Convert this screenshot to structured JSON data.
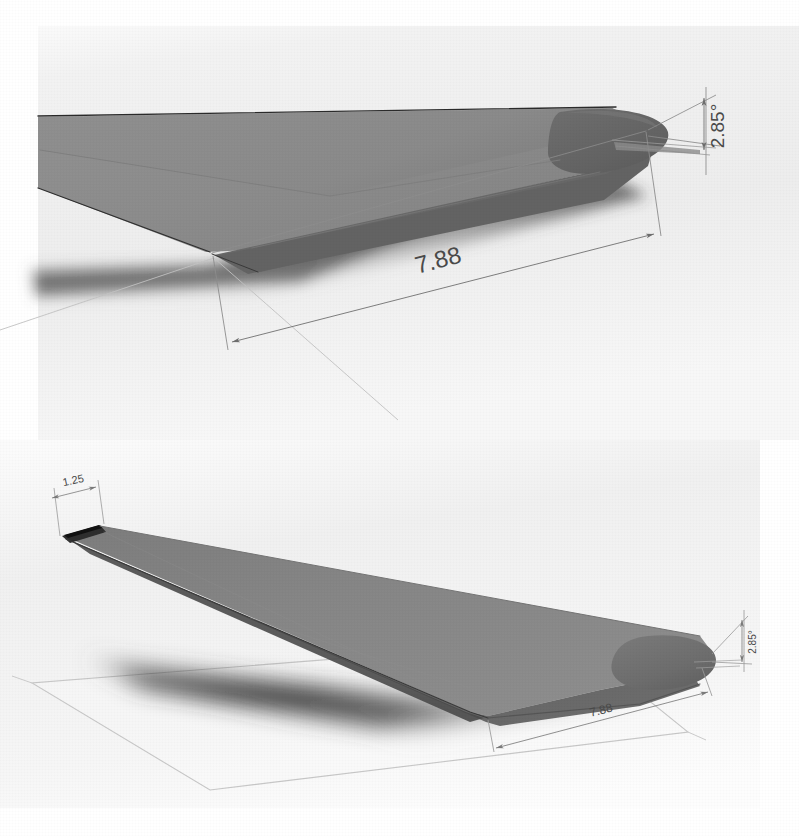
{
  "document": {
    "kind": "cad-render-sheet",
    "background_color": "#ffffff",
    "paper_tint": "#f3f3f3"
  },
  "palette": {
    "wing_upper_surface": "#8d8d8d",
    "wing_upper_surface_light": "#9a9a9a",
    "wing_lower_surface": "#6e6e6e",
    "wing_curved_dark": "#5f5f5f",
    "wing_edge_dark": "#2a2a2a",
    "shadow": "#3b3b3b",
    "dimension_line": "#8a8a8a",
    "dimension_line_dark": "#6d6d6d",
    "sketch_plane_outline": "#c9c9c9",
    "dimension_text": "#4a4a4a"
  },
  "views": [
    {
      "id": "view-top",
      "name": "wing-root-closeup-view",
      "description": "Close-up isometric render of tapered wing root with rounded airfoil leading edge",
      "dimensions": [
        {
          "id": "chord-length-top",
          "name": "chord-dimension",
          "value": "7.88",
          "type": "linear",
          "rotation_deg": -14.5
        },
        {
          "id": "twist-angle-top",
          "name": "angle-dimension",
          "value": "2.85°",
          "type": "angular",
          "rotation_deg": -90
        }
      ]
    },
    {
      "id": "view-bottom",
      "name": "full-wing-isometric-view",
      "description": "Full isometric render of tapered wing with sketch plane and cast shadow",
      "dimensions": [
        {
          "id": "tip-chord-bottom",
          "name": "tip-chord-dimension",
          "value": "1.25",
          "type": "linear",
          "rotation_deg": -12
        },
        {
          "id": "root-chord-bottom",
          "name": "root-chord-dimension",
          "value": "7.88",
          "type": "linear",
          "rotation_deg": -13
        },
        {
          "id": "twist-angle-bottom",
          "name": "angle-dimension",
          "value": "2.85°",
          "type": "angular",
          "rotation_deg": -90
        }
      ]
    }
  ]
}
